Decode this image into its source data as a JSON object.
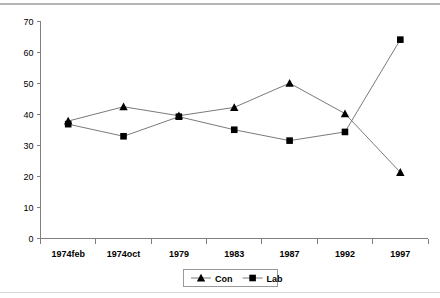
{
  "chart_data": {
    "type": "line",
    "title": "",
    "subtitle": "",
    "xlabel": "",
    "ylabel": "",
    "categories": [
      "1974feb",
      "1974oct",
      "1979",
      "1983",
      "1987",
      "1992",
      "1997"
    ],
    "series": [
      {
        "name": "Con",
        "marker": "triangle",
        "color": "#000000",
        "values": [
          37.8,
          42.4,
          39.5,
          42.2,
          50.0,
          40.2,
          21.3
        ]
      },
      {
        "name": "Lab",
        "marker": "square",
        "color": "#000000",
        "values": [
          36.8,
          32.9,
          39.2,
          35.0,
          31.5,
          34.3,
          64.0
        ]
      }
    ],
    "ylim": [
      0,
      70
    ],
    "ytick_step": 10,
    "yticks": [
      "0",
      "10",
      "20",
      "30",
      "40",
      "50",
      "60",
      "70"
    ],
    "grid": false,
    "legend_position": "bottom",
    "legend_entries": [
      "Con",
      "Lab"
    ],
    "line_color": "#7a7a7a",
    "axis_color": "#808080",
    "rule_color": "#b5b5b5"
  }
}
